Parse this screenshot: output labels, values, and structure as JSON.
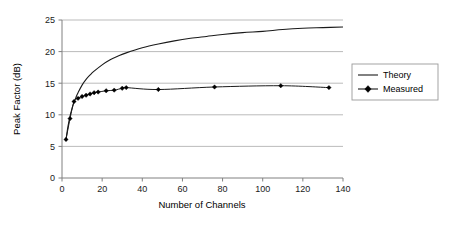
{
  "chart_data": {
    "type": "line",
    "title": "",
    "xlabel": "Number of Channels",
    "ylabel": "Peak Factor (dB)",
    "xlim": [
      0,
      140
    ],
    "ylim": [
      0,
      25
    ],
    "xticks": [
      0,
      20,
      40,
      60,
      80,
      100,
      120,
      140
    ],
    "yticks": [
      0,
      5,
      10,
      15,
      20,
      25
    ],
    "xtick_labels": [
      "0",
      "20",
      "40",
      "60",
      "80",
      "100",
      "120",
      "140"
    ],
    "ytick_labels": [
      "0",
      "5",
      "10",
      "15",
      "20",
      "25"
    ],
    "grid": "horizontal",
    "legend_position": "right-outside",
    "series": [
      {
        "name": "Theory",
        "marker": "none",
        "x": [
          2,
          3,
          4,
          5,
          6,
          7,
          8,
          10,
          12,
          14,
          16,
          20,
          24,
          28,
          32,
          40,
          48,
          56,
          64,
          72,
          80,
          90,
          100,
          110,
          120,
          130,
          140
        ],
        "y": [
          6.1,
          8.2,
          9.8,
          11.0,
          12.0,
          12.8,
          13.5,
          14.7,
          15.6,
          16.3,
          16.9,
          17.9,
          18.7,
          19.3,
          19.8,
          20.6,
          21.2,
          21.7,
          22.1,
          22.4,
          22.7,
          23.0,
          23.2,
          23.5,
          23.7,
          23.8,
          23.9
        ]
      },
      {
        "name": "Measured",
        "marker": "diamond",
        "x": [
          2,
          4,
          6,
          8,
          10,
          12,
          14,
          16,
          18,
          22,
          26,
          30,
          32,
          48,
          76,
          109,
          133
        ],
        "y": [
          6.1,
          9.4,
          12.1,
          12.6,
          12.9,
          13.1,
          13.3,
          13.5,
          13.6,
          13.8,
          13.9,
          14.2,
          14.3,
          14.0,
          14.4,
          14.6,
          14.3
        ]
      }
    ]
  },
  "legend": {
    "items": [
      {
        "label": "Theory"
      },
      {
        "label": "Measured"
      }
    ]
  },
  "axes": {
    "x_title": "Number of Channels",
    "y_title": "Peak Factor (dB)"
  }
}
